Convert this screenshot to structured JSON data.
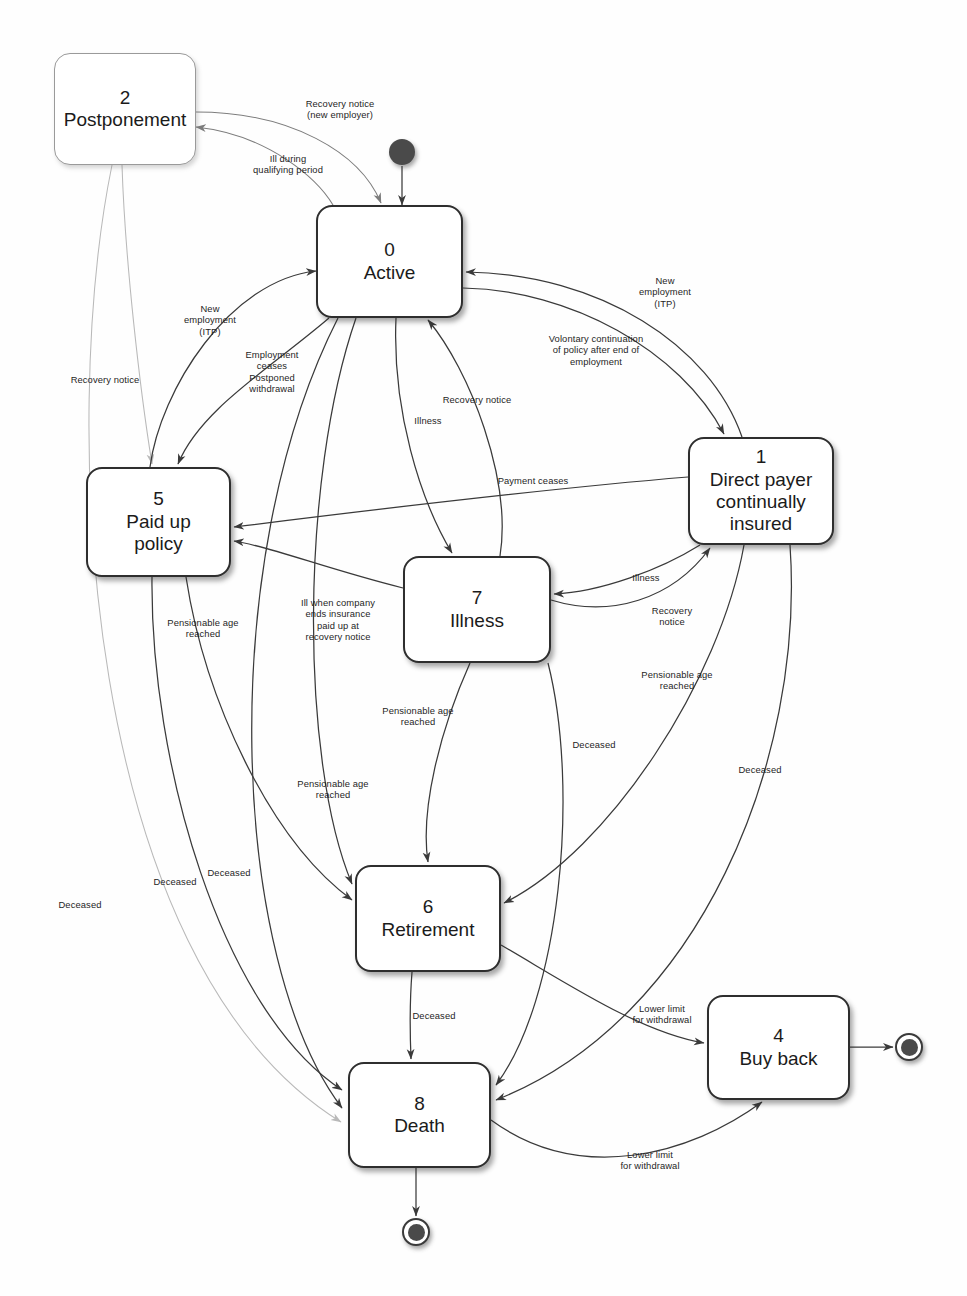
{
  "diagram": {
    "type": "uml-state-machine",
    "background_color": "#fefefe",
    "line_color": "#3a3a3a",
    "text_color": "#1b1b1b"
  },
  "states": [
    {
      "id": "0",
      "name": "Active",
      "x": 316,
      "y": 205,
      "w": 147,
      "h": 113,
      "style": "solid"
    },
    {
      "id": "1",
      "name": "Direct payer\ncontinually\ninsured",
      "x": 688,
      "y": 437,
      "w": 146,
      "h": 108,
      "style": "solid"
    },
    {
      "id": "2",
      "name": "Postponement",
      "x": 54,
      "y": 53,
      "w": 142,
      "h": 112,
      "style": "faint"
    },
    {
      "id": "4",
      "name": "Buy back",
      "x": 707,
      "y": 995,
      "w": 143,
      "h": 105,
      "style": "solid"
    },
    {
      "id": "5",
      "name": "Paid up\npolicy",
      "x": 86,
      "y": 467,
      "w": 145,
      "h": 110,
      "style": "solid"
    },
    {
      "id": "6",
      "name": "Retirement",
      "x": 355,
      "y": 865,
      "w": 146,
      "h": 107,
      "style": "solid"
    },
    {
      "id": "7",
      "name": "Illness",
      "x": 403,
      "y": 556,
      "w": 148,
      "h": 107,
      "style": "solid"
    },
    {
      "id": "8",
      "name": "Death",
      "x": 348,
      "y": 1062,
      "w": 143,
      "h": 106,
      "style": "solid"
    }
  ],
  "pseudostates": [
    {
      "kind": "initial",
      "name": "initial-state",
      "cx": 402,
      "cy": 152,
      "r": 13
    },
    {
      "kind": "final",
      "name": "final-state-death",
      "cx": 416,
      "cy": 1232,
      "r": 14
    },
    {
      "kind": "final",
      "name": "final-state-buyback",
      "cx": 909,
      "cy": 1047,
      "r": 14
    }
  ],
  "transitions": [
    {
      "id": "t1",
      "from": "initial",
      "to": "0",
      "label": ""
    },
    {
      "id": "t2",
      "from": "0",
      "to": "2",
      "label": "Ill during\nqualifying period",
      "label_x": 288,
      "label_y": 164
    },
    {
      "id": "t3",
      "from": "2",
      "to": "0",
      "label": "Recovery notice\n(new employer)",
      "label_x": 340,
      "label_y": 109
    },
    {
      "id": "t4",
      "from": "2",
      "to": "5",
      "label": "Recovery notice",
      "label_x": 105,
      "label_y": 380
    },
    {
      "id": "t5",
      "from": "2",
      "to": "8",
      "label": "Deceased",
      "label_x": 80,
      "label_y": 905
    },
    {
      "id": "t6",
      "from": "5",
      "to": "0",
      "label": "New\nemployment\n(ITP)",
      "label_x": 210,
      "label_y": 320
    },
    {
      "id": "t7",
      "from": "0",
      "to": "5",
      "label": "Employment\nceases\nPostponed\nwithdrawal",
      "label_x": 272,
      "label_y": 372
    },
    {
      "id": "t8",
      "from": "0",
      "to": "7",
      "label": "Illness",
      "label_x": 428,
      "label_y": 421
    },
    {
      "id": "t9",
      "from": "7",
      "to": "0",
      "label": "Recovery notice",
      "label_x": 477,
      "label_y": 400
    },
    {
      "id": "t10",
      "from": "0",
      "to": "1",
      "label": "Volontary continuation\nof policy after end of\nemployment",
      "label_x": 596,
      "label_y": 350
    },
    {
      "id": "t11",
      "from": "1",
      "to": "0",
      "label": "New\nemployment\n(ITP)",
      "label_x": 665,
      "label_y": 292
    },
    {
      "id": "t12",
      "from": "1",
      "to": "5",
      "label": "Payment ceases",
      "label_x": 533,
      "label_y": 481
    },
    {
      "id": "t13",
      "from": "1",
      "to": "7",
      "label": "Illness",
      "label_x": 646,
      "label_y": 578
    },
    {
      "id": "t14",
      "from": "7",
      "to": "1",
      "label": "Recovery\nnotice",
      "label_x": 672,
      "label_y": 616
    },
    {
      "id": "t15",
      "from": "7",
      "to": "5",
      "label": "Ill when company\nends insurance\npaid up at\nrecovery notice",
      "label_x": 338,
      "label_y": 620
    },
    {
      "id": "t16",
      "from": "5",
      "to": "6",
      "label": "Pensionable age\nreached",
      "label_x": 203,
      "label_y": 628
    },
    {
      "id": "t17",
      "from": "7",
      "to": "6",
      "label": "Pensionable age\nreached",
      "label_x": 418,
      "label_y": 716
    },
    {
      "id": "t18",
      "from": "0",
      "to": "6",
      "label": "Pensionable age\nreached",
      "label_x": 333,
      "label_y": 789
    },
    {
      "id": "t19",
      "from": "1",
      "to": "6",
      "label": "Pensionable age\nreached",
      "label_x": 677,
      "label_y": 680
    },
    {
      "id": "t20",
      "from": "7",
      "to": "8",
      "label": "Deceased",
      "label_x": 594,
      "label_y": 745
    },
    {
      "id": "t21",
      "from": "1",
      "to": "8",
      "label": "Deceased",
      "label_x": 760,
      "label_y": 770
    },
    {
      "id": "t22",
      "from": "5",
      "to": "8",
      "label": "Deceased",
      "label_x": 175,
      "label_y": 882
    },
    {
      "id": "t23",
      "from": "0",
      "to": "8",
      "label": "Deceased",
      "label_x": 229,
      "label_y": 873
    },
    {
      "id": "t24",
      "from": "6",
      "to": "8",
      "label": "Deceased",
      "label_x": 434,
      "label_y": 1016
    },
    {
      "id": "t25",
      "from": "6",
      "to": "4",
      "label": "Lower limit\nfor withdrawal",
      "label_x": 662,
      "label_y": 1014
    },
    {
      "id": "t26",
      "from": "8",
      "to": "4",
      "label": "Lower limit\nfor withdrawal",
      "label_x": 650,
      "label_y": 1160
    },
    {
      "id": "t27",
      "from": "4",
      "to": "final-state-buyback",
      "label": ""
    },
    {
      "id": "t28",
      "from": "8",
      "to": "final-state-death",
      "label": ""
    }
  ]
}
